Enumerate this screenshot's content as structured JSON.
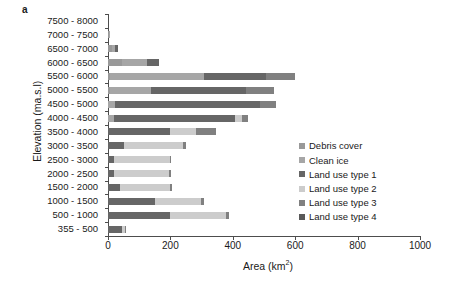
{
  "panel": {
    "letter": "a"
  },
  "axes": {
    "y_title": "Elevation (ma.s.l)",
    "x_title_main": "Area (km",
    "x_title_sup": "2",
    "x_title_close": ")",
    "x_ticks": [
      "0",
      "200",
      "400",
      "600",
      "800",
      "1000"
    ]
  },
  "legend": {
    "items": [
      {
        "label": "Debris cover",
        "color": "#999999"
      },
      {
        "label": "Clean ice",
        "color": "#a6a6a6"
      },
      {
        "label": "Land use type 1",
        "color": "#666666"
      },
      {
        "label": "Land use type 2",
        "color": "#cccccc"
      },
      {
        "label": "Land use type 3",
        "color": "#808080"
      },
      {
        "label": "Land use type 4",
        "color": "#595959"
      }
    ]
  },
  "chart_data": {
    "type": "bar",
    "orientation": "horizontal",
    "stacked": true,
    "title": "",
    "xlabel": "Area (km2)",
    "ylabel": "Elevation (ma.s.l)",
    "xlim": [
      0,
      1000
    ],
    "grid": false,
    "legend_position": "right",
    "categories": [
      "7500 - 8000",
      "7000 - 7500",
      "6500 - 7000",
      "6000 - 6500",
      "5500 - 6000",
      "5000 - 5500",
      "4500 - 5000",
      "4000 - 4500",
      "3500 - 4000",
      "3000 - 3500",
      "2500 - 3000",
      "2000 - 2500",
      "1500 - 2000",
      "1000 - 1500",
      "500 - 1000",
      "355 - 500"
    ],
    "series": [
      {
        "name": "Debris cover",
        "color": "#999999",
        "values": [
          0,
          3,
          14,
          45,
          8,
          8,
          0,
          0,
          0,
          0,
          0,
          0,
          0,
          0,
          0,
          0
        ]
      },
      {
        "name": "Clean ice",
        "color": "#a6a6a6",
        "values": [
          0,
          4,
          10,
          80,
          300,
          130,
          22,
          18,
          0,
          0,
          0,
          0,
          0,
          0,
          0,
          0
        ]
      },
      {
        "name": "Land use type 1",
        "color": "#666666",
        "values": [
          0,
          0,
          8,
          40,
          200,
          305,
          465,
          390,
          200,
          50,
          18,
          18,
          40,
          150,
          200,
          45
        ]
      },
      {
        "name": "Land use type 2",
        "color": "#cccccc",
        "values": [
          0,
          0,
          0,
          0,
          0,
          0,
          0,
          20,
          82,
          190,
          180,
          178,
          160,
          148,
          178,
          8
        ]
      },
      {
        "name": "Land use type 3",
        "color": "#808080",
        "values": [
          0,
          0,
          0,
          0,
          90,
          90,
          50,
          20,
          63,
          10,
          5,
          5,
          5,
          10,
          10,
          4
        ]
      },
      {
        "name": "Land use type 4",
        "color": "#595959",
        "values": [
          0,
          0,
          0,
          0,
          0,
          0,
          0,
          0,
          0,
          0,
          0,
          0,
          0,
          0,
          0,
          0
        ]
      }
    ],
    "totals": [
      0,
      7,
      32,
      165,
      598,
      533,
      537,
      448,
      345,
      250,
      203,
      201,
      205,
      308,
      388,
      57
    ]
  }
}
